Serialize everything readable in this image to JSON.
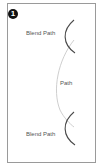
{
  "figure": {
    "step_number": "1",
    "labels": {
      "top_blend": "Blend Path",
      "path": "Path",
      "bottom_blend": "Blend Path"
    },
    "colors": {
      "frame": "#9a9a9a",
      "blend_path": "#4a4a4a",
      "path": "#c8c8c8",
      "badge": "#111111",
      "text": "#555555"
    }
  }
}
